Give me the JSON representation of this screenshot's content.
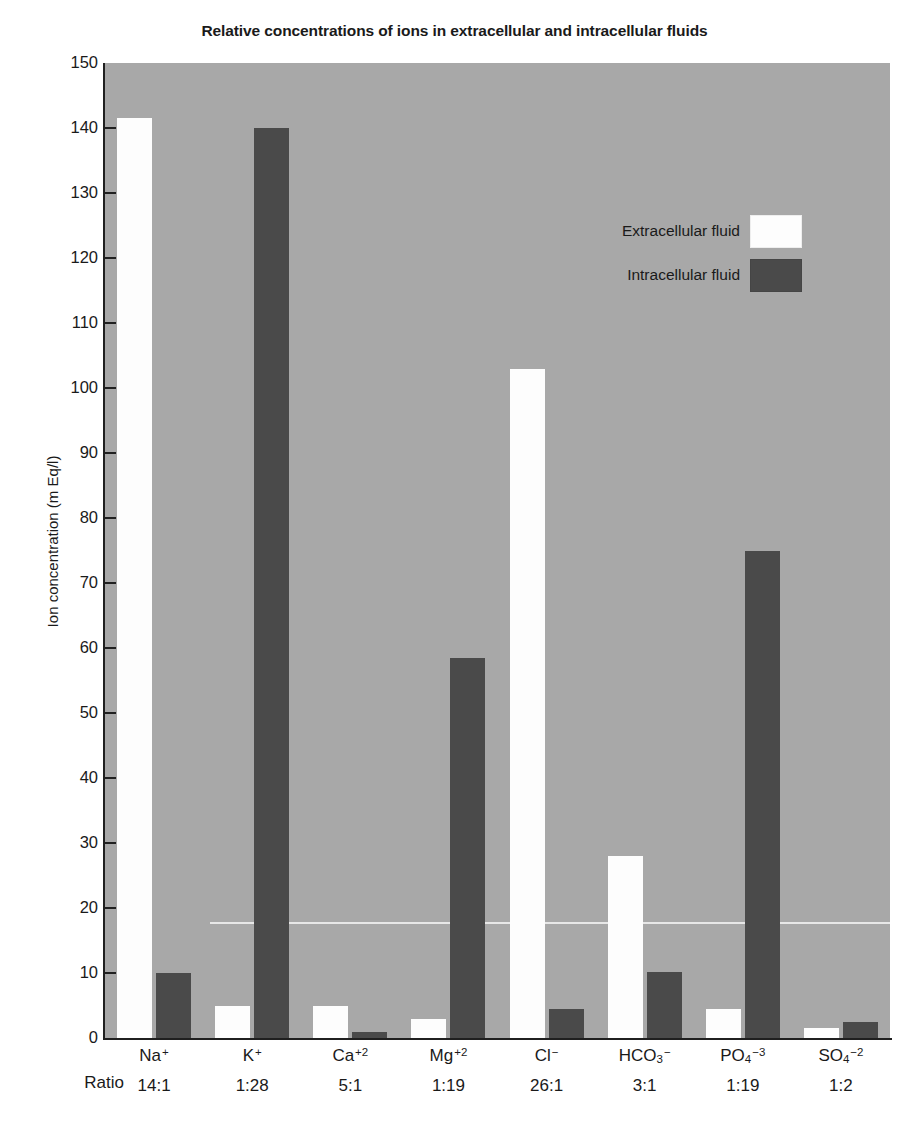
{
  "scan_fragment": "",
  "chart_title": "Relative concentrations of ions in extracellular and intracellular fluids",
  "y_axis_title": "Ion concentration (m Eq/l)",
  "ratio_caption": "Ratio",
  "legend": [
    {
      "label": "Extracellular fluid",
      "swatch": "ecf",
      "color": "#fdfdfd"
    },
    {
      "label": "Intracellular fluid",
      "swatch": "icf",
      "color": "#4a4a4a"
    }
  ],
  "colors": {
    "plot_background": "#a8a8a8",
    "extracellular_bar": "#fdfdfd",
    "intracellular_bar": "#4a4a4a",
    "axis": "#202020",
    "text": "#1a1a1a"
  },
  "chart_data": {
    "type": "bar",
    "title": "Relative concentrations of ions in extracellular and intracellular fluids",
    "xlabel": "",
    "ylabel": "Ion concentration (m Eq/l)",
    "ylim": [
      0,
      150
    ],
    "yticks": [
      0,
      10,
      20,
      30,
      40,
      50,
      60,
      70,
      80,
      90,
      100,
      110,
      120,
      130,
      140,
      150
    ],
    "ytick_labels": [
      "0",
      "10",
      "20",
      "30",
      "40",
      "50",
      "60",
      "70",
      "80",
      "90",
      "100",
      "110",
      "120",
      "130",
      "140",
      "150"
    ],
    "grid": false,
    "legend_position": "inside-top-center",
    "categories": [
      "Na +",
      "K +",
      "Ca +2",
      "Mg +2",
      "Cl -",
      "HCO3 -",
      "PO4 -3",
      "SO4 -2"
    ],
    "category_ratios": [
      "14:1",
      "1:28",
      "5:1",
      "1:19",
      "26:1",
      "3:1",
      "1:19",
      "1:2"
    ],
    "series": [
      {
        "name": "Extracellular fluid",
        "values": [
          141.5,
          5,
          5,
          3,
          103,
          28,
          4.5,
          1.5
        ]
      },
      {
        "name": "Intracellular fluid",
        "values": [
          10,
          140,
          1,
          58.5,
          4.5,
          10.2,
          75,
          2.5
        ]
      }
    ]
  },
  "ions": [
    {
      "symbol": "Na",
      "charge": "+",
      "sub": "",
      "ratio": "14:1"
    },
    {
      "symbol": "K",
      "charge": "+",
      "sub": "",
      "ratio": "1:28"
    },
    {
      "symbol": "Ca",
      "charge": "+2",
      "sub": "",
      "ratio": "5:1"
    },
    {
      "symbol": "Mg",
      "charge": "+2",
      "sub": "",
      "ratio": "1:19"
    },
    {
      "symbol": "Cl",
      "charge": "−",
      "sub": "",
      "ratio": "26:1"
    },
    {
      "symbol": "HCO",
      "charge": "−",
      "sub": "3",
      "ratio": "3:1"
    },
    {
      "symbol": "PO",
      "charge": "−3",
      "sub": "4",
      "ratio": "1:19"
    },
    {
      "symbol": "SO",
      "charge": "−2",
      "sub": "4",
      "ratio": "1:2"
    }
  ]
}
